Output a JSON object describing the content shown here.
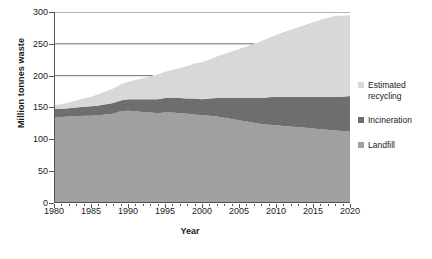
{
  "chart_data": {
    "type": "area",
    "stacked": true,
    "title": "",
    "xlabel": "Year",
    "ylabel": "Million tonnes waste",
    "xlim": [
      1980,
      2020
    ],
    "ylim": [
      0,
      300
    ],
    "yticks": [
      0,
      50,
      100,
      150,
      200,
      250,
      300
    ],
    "xticks": [
      1980,
      1985,
      1990,
      1995,
      2000,
      2005,
      2010,
      2015,
      2020
    ],
    "x_minor_tick_interval": 1,
    "grid": "partial-horizontal",
    "gridlines": [
      200,
      250,
      300
    ],
    "legend_position": "right",
    "x": [
      1980,
      1981,
      1982,
      1983,
      1984,
      1985,
      1986,
      1987,
      1988,
      1989,
      1990,
      1991,
      1992,
      1993,
      1994,
      1995,
      1996,
      1997,
      1998,
      1999,
      2000,
      2001,
      2002,
      2003,
      2004,
      2005,
      2006,
      2007,
      2008,
      2009,
      2010,
      2011,
      2012,
      2013,
      2014,
      2015,
      2016,
      2017,
      2018,
      2019,
      2020
    ],
    "series": [
      {
        "name": "Landfill",
        "color": "#a0a0a0",
        "values": [
          135,
          135,
          136,
          136,
          137,
          137,
          138,
          139,
          140,
          144,
          145,
          144,
          143,
          142,
          141,
          142,
          142,
          141,
          140,
          139,
          138,
          137,
          136,
          134,
          132,
          130,
          128,
          126,
          124,
          123,
          122,
          121,
          120,
          119,
          118,
          117,
          116,
          115,
          114,
          113,
          113
        ]
      },
      {
        "name": "Incineration",
        "color": "#6e6e6e",
        "values": [
          13,
          13,
          13,
          14,
          14,
          15,
          15,
          16,
          17,
          17,
          18,
          19,
          20,
          21,
          22,
          23,
          23,
          24,
          24,
          25,
          25,
          27,
          29,
          31,
          33,
          35,
          37,
          39,
          41,
          43,
          45,
          46,
          47,
          48,
          49,
          50,
          51,
          52,
          53,
          54,
          55
        ]
      },
      {
        "name": "Estimated recycling",
        "color": "#d8d8d8",
        "values": [
          6,
          7,
          9,
          11,
          13,
          15,
          18,
          20,
          23,
          25,
          27,
          30,
          33,
          36,
          39,
          41,
          44,
          47,
          51,
          55,
          58,
          61,
          65,
          69,
          73,
          77,
          81,
          85,
          89,
          93,
          97,
          101,
          105,
          109,
          113,
          117,
          121,
          124,
          127,
          127,
          127
        ]
      }
    ],
    "totals": [
      154,
      155,
      158,
      161,
      164,
      167,
      171,
      175,
      180,
      186,
      190,
      193,
      196,
      199,
      202,
      206,
      209,
      212,
      215,
      219,
      221,
      225,
      230,
      234,
      238,
      242,
      246,
      250,
      254,
      259,
      264,
      268,
      272,
      276,
      280,
      284,
      288,
      291,
      294,
      294,
      295
    ]
  },
  "axes": {
    "y_title": "Million tonnes waste",
    "x_title": "Year",
    "y_tick_labels": [
      "300",
      "250",
      "200",
      "150",
      "100",
      "50",
      "0"
    ],
    "x_tick_labels": [
      "1980",
      "1985",
      "1990",
      "1995",
      "2000",
      "2005",
      "2010",
      "2015",
      "2020"
    ]
  },
  "legend": {
    "items": [
      {
        "label_line1": "Estimated",
        "label_line2": "recycling",
        "color": "#d8d8d8",
        "name": "estimated-recycling"
      },
      {
        "label_line1": "Incineration",
        "label_line2": "",
        "color": "#6e6e6e",
        "name": "incineration"
      },
      {
        "label_line1": "Landfill",
        "label_line2": "",
        "color": "#a0a0a0",
        "name": "landfill"
      }
    ]
  },
  "caption": {
    "text": ""
  }
}
